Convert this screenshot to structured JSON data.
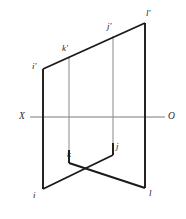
{
  "figure": {
    "kind": "orthographic-projection-diagram",
    "background_color": "#ffffff",
    "canvas": {
      "width": 186,
      "height": 219
    }
  },
  "colors": {
    "outline": "#1a1a1a",
    "interior_line": "#8a8a8a",
    "ground_line": "#7a7a7a",
    "label_text": "#1a1a1a",
    "axis_label_text": "#2b2b2b"
  },
  "ground_line": {
    "name": "XO",
    "start_label": "X",
    "end_label": "O",
    "y": 117,
    "x_start": 30,
    "x_end": 165,
    "start_label_pos": {
      "x": 19,
      "y": 112
    },
    "end_label_pos": {
      "x": 168,
      "y": 112
    }
  },
  "points": {
    "i_prime": {
      "label": "i'",
      "x": 43,
      "y": 69,
      "label_pos": {
        "x": 32,
        "y": 62
      }
    },
    "k_prime": {
      "label": "k'",
      "x": 69,
      "y": 58,
      "label_pos": {
        "x": 62,
        "y": 44
      }
    },
    "j_prime": {
      "label": "j'",
      "x": 113,
      "y": 36,
      "label_pos": {
        "x": 107,
        "y": 22
      }
    },
    "l_prime": {
      "label": "l'",
      "x": 145,
      "y": 23,
      "label_pos": {
        "x": 146,
        "y": 9
      }
    },
    "i": {
      "label": "i",
      "x": 43,
      "y": 189,
      "label_pos": {
        "x": 33,
        "y": 191
      }
    },
    "k": {
      "label": "k",
      "x": 69,
      "y": 163,
      "label_pos": {
        "x": 67,
        "y": 150
      }
    },
    "j": {
      "label": "j",
      "x": 113,
      "y": 155,
      "label_pos": {
        "x": 116,
        "y": 142
      }
    },
    "l": {
      "label": "l",
      "x": 145,
      "y": 188,
      "label_pos": {
        "x": 149,
        "y": 189
      }
    }
  },
  "edges": {
    "outline": [
      {
        "name": "edge-i-prime-l-prime",
        "x1": 43,
        "y1": 69,
        "x2": 145,
        "y2": 23
      },
      {
        "name": "edge-i-prime-i",
        "x1": 43,
        "y1": 69,
        "x2": 43,
        "y2": 189
      },
      {
        "name": "edge-l-prime-l",
        "x1": 145,
        "y1": 23,
        "x2": 145,
        "y2": 188
      },
      {
        "name": "edge-i-j",
        "x1": 43,
        "y1": 189,
        "x2": 113,
        "y2": 155
      },
      {
        "name": "edge-k-l",
        "x1": 69,
        "y1": 163,
        "x2": 145,
        "y2": 188
      },
      {
        "name": "edge-k-k-vertical",
        "x1": 69,
        "y1": 163,
        "x2": 69,
        "y2": 150
      },
      {
        "name": "edge-j-j-vertical",
        "x1": 113,
        "y1": 155,
        "x2": 113,
        "y2": 143
      }
    ],
    "interior": [
      {
        "name": "edge-k-prime-k",
        "x1": 69,
        "y1": 58,
        "x2": 69,
        "y2": 163
      },
      {
        "name": "edge-j-prime-j",
        "x1": 113,
        "y1": 36,
        "x2": 113,
        "y2": 155
      }
    ]
  },
  "labels": [
    {
      "key": "i_prime"
    },
    {
      "key": "k_prime"
    },
    {
      "key": "j_prime"
    },
    {
      "key": "l_prime"
    },
    {
      "key": "i"
    },
    {
      "key": "k"
    },
    {
      "key": "j"
    },
    {
      "key": "l"
    }
  ]
}
